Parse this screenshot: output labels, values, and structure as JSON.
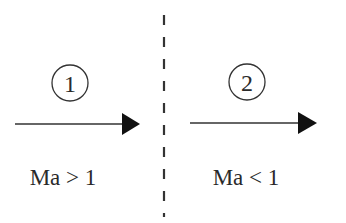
{
  "diagram": {
    "boundary": {
      "style": "dashed",
      "color": "#333333"
    },
    "regions": [
      {
        "id": "region-1",
        "marker": "1",
        "condition": "Ma > 1",
        "arrow_direction": "right"
      },
      {
        "id": "region-2",
        "marker": "2",
        "condition": "Ma < 1",
        "arrow_direction": "right"
      }
    ],
    "colors": {
      "line": "#333333",
      "arrowhead": "#111111",
      "text": "#2a2a2a",
      "background": "#ffffff"
    }
  }
}
